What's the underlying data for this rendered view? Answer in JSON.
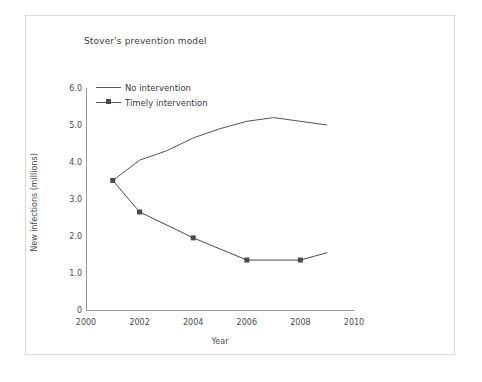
{
  "chart_data": {
    "type": "line",
    "title": "Stover's prevention model",
    "xlabel": "Year",
    "ylabel": "New infections (millions)",
    "xlim": [
      2000,
      2010
    ],
    "ylim": [
      0,
      6
    ],
    "grid": false,
    "legend_position": "upper-left-inside",
    "x_ticks": [
      "2000",
      "2002",
      "2004",
      "2006",
      "2008",
      "2010"
    ],
    "x_tick_values": [
      2000,
      2002,
      2004,
      2006,
      2008,
      2010
    ],
    "y_ticks": [
      "6.0",
      "5.0",
      "4.0",
      "3.0",
      "2.0",
      "1.0",
      "0"
    ],
    "y_tick_values": [
      6.0,
      5.0,
      4.0,
      3.0,
      2.0,
      1.0,
      0
    ],
    "series": [
      {
        "name": "No intervention",
        "marker": "none",
        "color": "#555555",
        "x": [
          2001,
          2002,
          2003,
          2004,
          2005,
          2006,
          2007,
          2008,
          2009
        ],
        "values": [
          3.5,
          4.05,
          4.3,
          4.65,
          4.9,
          5.1,
          5.2,
          5.1,
          5.0
        ]
      },
      {
        "name": "Timely intervention",
        "marker": "square",
        "color": "#4a4a4a",
        "x": [
          2001,
          2002,
          2004,
          2006,
          2008,
          2009
        ],
        "values": [
          3.5,
          2.65,
          1.95,
          1.35,
          1.35,
          1.55
        ]
      }
    ]
  },
  "legend": {
    "entries": [
      {
        "label": "No intervention"
      },
      {
        "label": "Timely intervention"
      }
    ]
  },
  "colors": {
    "line": "#555555",
    "marker": "#4a4a4a",
    "axis": "#9a9a9a",
    "text": "#3b3b3b",
    "frame": "#d9d9d9",
    "background": "#ffffff"
  }
}
